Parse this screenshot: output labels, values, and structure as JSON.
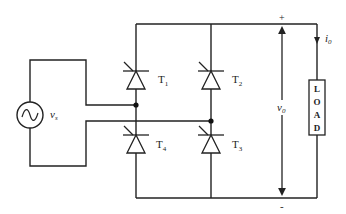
{
  "diagram": {
    "type": "single-phase full-wave thyristor bridge rectifier",
    "colors": {
      "wire": "#222222",
      "background": "#ffffff"
    },
    "source": {
      "symbol": "ac-source-icon",
      "label": "v",
      "label_sub": "s"
    },
    "thyristors": [
      {
        "id": "T1",
        "label": "T",
        "sub": "1"
      },
      {
        "id": "T2",
        "label": "T",
        "sub": "2"
      },
      {
        "id": "T3",
        "label": "T",
        "sub": "3"
      },
      {
        "id": "T4",
        "label": "T",
        "sub": "4"
      }
    ],
    "output_voltage": {
      "label": "v",
      "sub": "0",
      "plus": "+",
      "minus": "-"
    },
    "output_current": {
      "label": "i",
      "sub": "0"
    },
    "load": {
      "letters": [
        "L",
        "O",
        "A",
        "D"
      ]
    }
  }
}
